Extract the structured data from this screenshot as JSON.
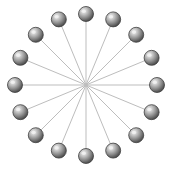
{
  "figure": {
    "type": "radial-star-graph",
    "canvas": {
      "width": 174,
      "height": 172,
      "background": "#ffffff"
    },
    "layout": {
      "center_x": 86,
      "center_y": 85,
      "radius": 71,
      "node_count": 16,
      "angle_step_degrees": 22.5,
      "start_angle_degrees": -90
    },
    "node_style": {
      "diameter": 15,
      "fill_light": "#e8e8e8",
      "fill_mid": "#9a9a9a",
      "fill_dark": "#4a4a4a",
      "stroke": "#3f3f3f",
      "stroke_width": 0.8,
      "highlight_offset_x": "35%",
      "highlight_offset_y": "32%"
    },
    "edge_style": {
      "color": "#bdbdbd",
      "width": 1,
      "count": 16,
      "description": "spokes from each node to shared center hub"
    },
    "hub": {
      "visible": false,
      "label": ""
    },
    "nodes": [
      {
        "id": "n1",
        "label": "1",
        "angle": -90,
        "x": 86,
        "y": 14
      },
      {
        "id": "n2",
        "label": "2",
        "angle": -67.5,
        "x": 113.17,
        "y": 19.39
      },
      {
        "id": "n3",
        "label": "3",
        "angle": -45,
        "x": 136.21,
        "y": 34.79
      },
      {
        "id": "n4",
        "label": "4",
        "angle": -22.5,
        "x": 151.61,
        "y": 57.83
      },
      {
        "id": "n5",
        "label": "5",
        "angle": 0,
        "x": 157,
        "y": 85
      },
      {
        "id": "n6",
        "label": "6",
        "angle": 22.5,
        "x": 151.61,
        "y": 112.17
      },
      {
        "id": "n7",
        "label": "7",
        "angle": 45,
        "x": 136.21,
        "y": 135.21
      },
      {
        "id": "n8",
        "label": "8",
        "angle": 67.5,
        "x": 113.17,
        "y": 150.61
      },
      {
        "id": "n9",
        "label": "9",
        "angle": 90,
        "x": 86,
        "y": 156
      },
      {
        "id": "n10",
        "label": "10",
        "angle": 112.5,
        "x": 58.83,
        "y": 150.61
      },
      {
        "id": "n11",
        "label": "11",
        "angle": 135,
        "x": 35.79,
        "y": 135.21
      },
      {
        "id": "n12",
        "label": "12",
        "angle": 157.5,
        "x": 20.39,
        "y": 112.17
      },
      {
        "id": "n13",
        "label": "13",
        "angle": 180,
        "x": 15,
        "y": 85
      },
      {
        "id": "n14",
        "label": "14",
        "angle": 202.5,
        "x": 20.39,
        "y": 57.83
      },
      {
        "id": "n15",
        "label": "15",
        "angle": 225,
        "x": 35.79,
        "y": 34.79
      },
      {
        "id": "n16",
        "label": "16",
        "angle": 247.5,
        "x": 58.83,
        "y": 19.39
      }
    ],
    "edges": [
      {
        "from": "n1",
        "to": "hub"
      },
      {
        "from": "n2",
        "to": "hub"
      },
      {
        "from": "n3",
        "to": "hub"
      },
      {
        "from": "n4",
        "to": "hub"
      },
      {
        "from": "n5",
        "to": "hub"
      },
      {
        "from": "n6",
        "to": "hub"
      },
      {
        "from": "n7",
        "to": "hub"
      },
      {
        "from": "n8",
        "to": "hub"
      },
      {
        "from": "n9",
        "to": "hub"
      },
      {
        "from": "n10",
        "to": "hub"
      },
      {
        "from": "n11",
        "to": "hub"
      },
      {
        "from": "n12",
        "to": "hub"
      },
      {
        "from": "n13",
        "to": "hub"
      },
      {
        "from": "n14",
        "to": "hub"
      },
      {
        "from": "n15",
        "to": "hub"
      },
      {
        "from": "n16",
        "to": "hub"
      }
    ]
  }
}
